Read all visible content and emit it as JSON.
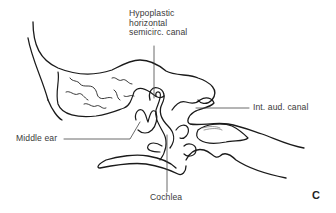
{
  "diagram": {
    "panel_letter": "C",
    "labels": [
      {
        "id": "hypoplastic-canal",
        "text": "Hypoplastic\nhorizontal\nsemicirc. canal"
      },
      {
        "id": "int-aud-canal",
        "text": "Int. aud. canal"
      },
      {
        "id": "middle-ear",
        "text": "Middle ear"
      },
      {
        "id": "cochlea",
        "text": "Cochlea"
      }
    ],
    "colors": {
      "outline": "#1a1a1a",
      "leader": "#444444",
      "text": "#3a3a3a",
      "background": "#ffffff"
    }
  }
}
